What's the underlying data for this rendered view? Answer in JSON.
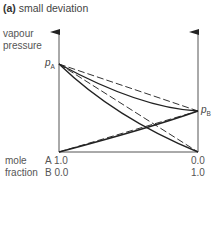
{
  "title": {
    "tag": "(a)",
    "text": "small deviation"
  },
  "y_axis": {
    "line1": "vapour",
    "line2": "pressure"
  },
  "labels": {
    "pA": "p",
    "pA_sub": "A",
    "pB": "p",
    "pB_sub": "B"
  },
  "x_axis": {
    "label_line1": "mole",
    "label_line2": "fraction",
    "left_top": "A 1.0",
    "left_bottom": "B 0.0",
    "right_top": "0.0",
    "right_bottom": "1.0"
  },
  "colors": {
    "line": "#333333",
    "axis": "#555555"
  },
  "legend_semantics": {
    "dashed": "ideal (Raoult's law)",
    "solid": "real (small deviation)"
  }
}
